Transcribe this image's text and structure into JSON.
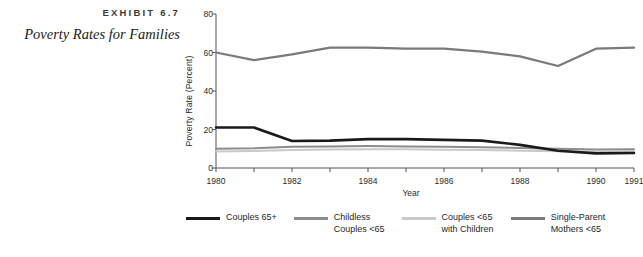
{
  "exhibit": {
    "label": "EXHIBIT 6.7",
    "title": "Poverty Rates for Families"
  },
  "colors": {
    "couples_65_plus": "#1a1a1a",
    "childless_couples_under65": "#8c8c8c",
    "couples_under65_with_children": "#c9c9c9",
    "single_parent_mothers_under65": "#7a7a7a",
    "axis": "#555555"
  },
  "chart_data": {
    "type": "line",
    "title": "Poverty Rates for Families",
    "xlabel": "Year",
    "ylabel": "Poverty Rate (Percent)",
    "xlim": [
      1980,
      1991
    ],
    "ylim": [
      0,
      80
    ],
    "yticks": [
      0,
      20,
      40,
      60,
      80
    ],
    "xticks": [
      1980,
      1982,
      1984,
      1986,
      1988,
      1990,
      1991
    ],
    "xtick_labels": [
      "1980",
      "1982",
      "1984",
      "1986",
      "1988",
      "1990",
      "1991"
    ],
    "minor_xticks": [
      1981,
      1983,
      1985,
      1987,
      1989
    ],
    "grid": false,
    "legend_position": "below",
    "x": [
      1980,
      1981,
      1982,
      1983,
      1984,
      1985,
      1986,
      1987,
      1988,
      1989,
      1990,
      1991
    ],
    "series": [
      {
        "name": "Couples 65+",
        "legend_label": "Couples 65+",
        "color": "#1a1a1a",
        "width": 2.6,
        "values": [
          21.0,
          21.0,
          14.0,
          14.2,
          15.0,
          15.0,
          14.6,
          14.2,
          12.0,
          9.0,
          7.6,
          7.8
        ]
      },
      {
        "name": "Childless Couples <65",
        "legend_label": "Childless\nCouples <65",
        "color": "#8c8c8c",
        "width": 2.0,
        "values": [
          10.0,
          10.2,
          11.0,
          11.2,
          11.4,
          11.2,
          11.0,
          10.8,
          10.4,
          10.0,
          9.6,
          9.8
        ]
      },
      {
        "name": "Couples <65 with Children",
        "legend_label": "Couples <65\nwith Children",
        "color": "#c9c9c9",
        "width": 2.0,
        "values": [
          8.6,
          8.8,
          9.4,
          9.6,
          9.8,
          9.7,
          9.5,
          9.3,
          9.0,
          8.7,
          8.5,
          8.6
        ]
      },
      {
        "name": "Single-Parent Mothers <65",
        "legend_label": "Single-Parent\nMothers <65",
        "color": "#7a7a7a",
        "width": 2.2,
        "values": [
          60.0,
          56.0,
          59.0,
          62.5,
          62.5,
          62.0,
          62.0,
          60.5,
          58.0,
          53.0,
          62.0,
          62.5
        ]
      }
    ]
  }
}
